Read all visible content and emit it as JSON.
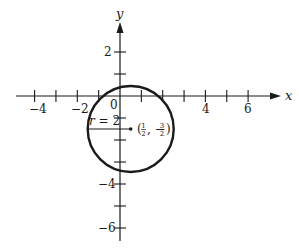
{
  "figure": {
    "x_axis": {
      "label": "x",
      "tick_labels": [
        {
          "value": -4,
          "text": "−4"
        },
        {
          "value": -2,
          "text": "−2"
        },
        {
          "value": 4,
          "text": "4"
        },
        {
          "value": 6,
          "text": "6"
        }
      ],
      "origin_label": "0",
      "tick_values": [
        -4,
        -3,
        -2,
        -1,
        1,
        2,
        3,
        4,
        5,
        6
      ]
    },
    "y_axis": {
      "label": "y",
      "tick_labels": [
        {
          "value": 2,
          "text": "2"
        },
        {
          "value": -4,
          "text": "−4"
        },
        {
          "value": -6,
          "text": "−6"
        }
      ],
      "tick_values": [
        2,
        1,
        -1,
        -2,
        -3,
        -4,
        -5,
        -6
      ]
    },
    "circle": {
      "center": {
        "x": 0.5,
        "y": -1.5
      },
      "radius": 2,
      "center_label_open": "(",
      "center_label_x_num": "1",
      "center_label_x_den": "2",
      "center_label_sep": ", −",
      "center_label_y_num": "3",
      "center_label_y_den": "2",
      "center_label_close": ")",
      "radius_label_var": "r",
      "radius_label_rest": " = 2"
    },
    "colors": {
      "ink": "#1a1a1a",
      "background": "#ffffff"
    }
  }
}
